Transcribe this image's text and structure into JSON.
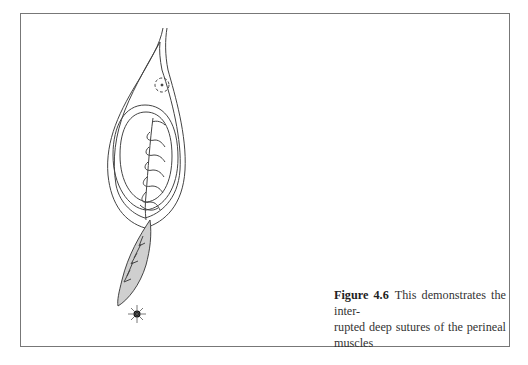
{
  "figure": {
    "label": "Figure 4.6",
    "caption_line1": "This demonstrates the inter-",
    "caption_line2": "rupted deep sutures of the perineal muscles",
    "caption": "This demonstrates the interrupted deep sutures of the perineal muscles",
    "illustration": "line drawing of perineum showing interrupted deep sutures of the perineal muscles, stippled wound area and anus below"
  }
}
